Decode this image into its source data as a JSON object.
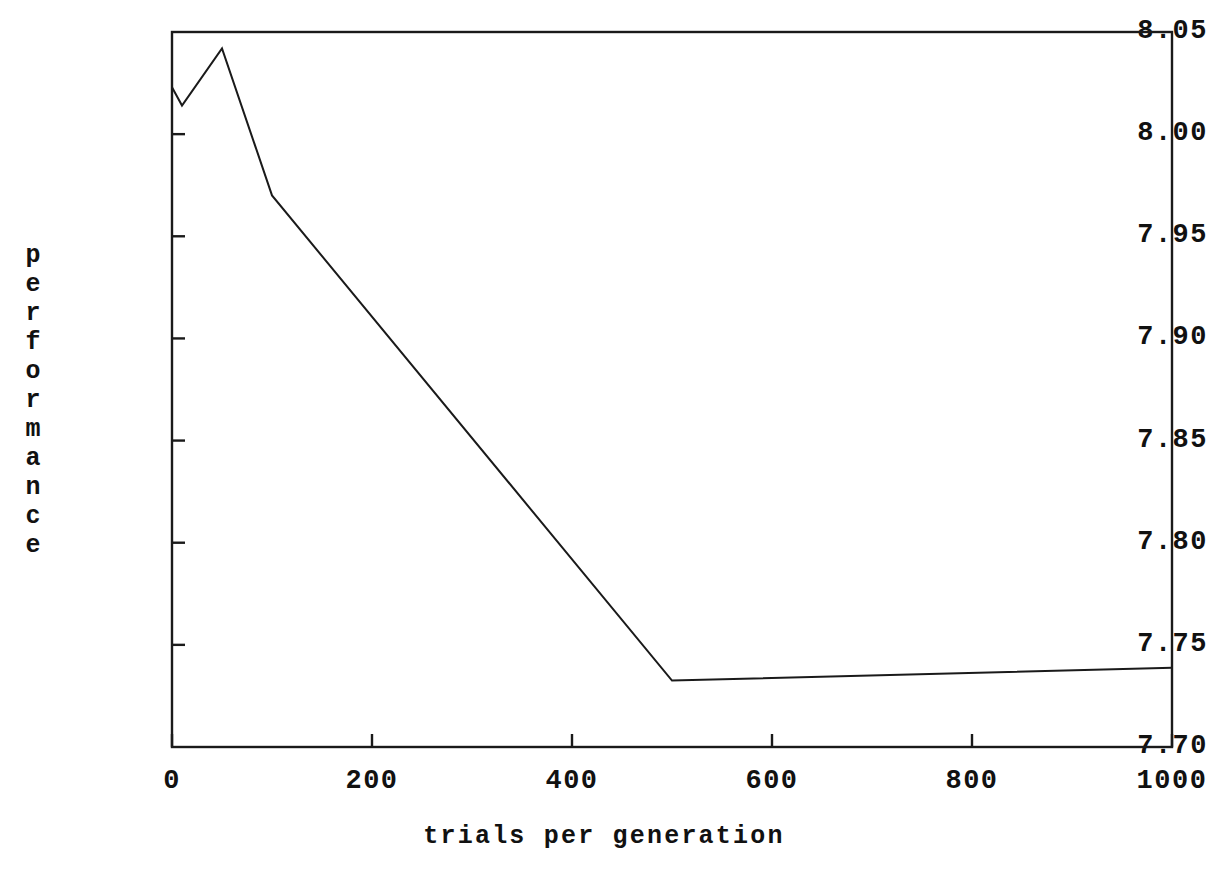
{
  "chart_data": {
    "type": "line",
    "title": "",
    "subtitle": "",
    "xlabel": "trials per generation",
    "ylabel": "performance",
    "ylabel_chars": [
      "p",
      "e",
      "r",
      "f",
      "o",
      "r",
      "m",
      "a",
      "n",
      "c",
      "e"
    ],
    "xlim": [
      0,
      1000
    ],
    "ylim": [
      7.7,
      8.05
    ],
    "xticks": [
      0,
      200,
      400,
      600,
      800,
      1000
    ],
    "xtick_labels": [
      "0",
      "200",
      "400",
      "600",
      "800",
      "1000"
    ],
    "yticks": [
      7.7,
      7.75,
      7.8,
      7.85,
      7.9,
      7.95,
      8.0,
      8.05
    ],
    "ytick_labels": [
      "8.05",
      "8.00",
      "7.95",
      "7.90",
      "7.85",
      "7.80",
      "7.75",
      "7.70"
    ],
    "grid": false,
    "legend": null,
    "legend_position": "none",
    "line_color": "#1a1a1a",
    "line_width": 2,
    "frame_color": "#1a1a1a",
    "background": "#ffffff",
    "series": [
      {
        "name": "performance",
        "x": [
          0,
          10,
          50,
          100,
          500,
          1000
        ],
        "y": [
          8.023,
          8.014,
          8.042,
          7.97,
          7.7325,
          7.7388
        ]
      }
    ],
    "annotations": []
  },
  "axes": {
    "y_tick_positions_px": [
      32,
      135,
      238,
      340,
      442,
      544,
      646,
      747
    ],
    "x_tick_positions_px": [
      172,
      372,
      572,
      772,
      972,
      1172
    ],
    "frame_px": {
      "left": 172,
      "right": 1172,
      "top": 32,
      "bottom": 747
    }
  }
}
